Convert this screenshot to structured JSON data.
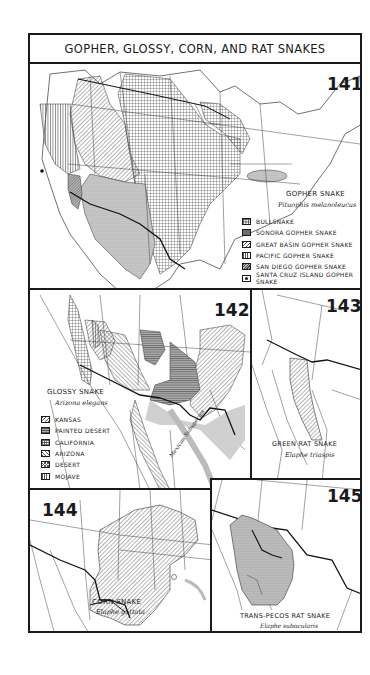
{
  "page": {
    "title": "GOPHER, GLOSSY, CORN, AND RAT SNAKES"
  },
  "maps": [
    {
      "number": "141",
      "common_name": "GOPHER SNAKE",
      "scientific_name": "Pituophis melanoleucus",
      "legend": [
        {
          "label": "BULLSNAKE",
          "pattern": "cross-grid"
        },
        {
          "label": "SONORA GOPHER SNAKE",
          "pattern": "stipple"
        },
        {
          "label": "GREAT BASIN GOPHER SNAKE",
          "pattern": "diagonal-lines"
        },
        {
          "label": "PACIFIC GOPHER SNAKE",
          "pattern": "vertical-lines"
        },
        {
          "label": "SAN DIEGO GOPHER SNAKE",
          "pattern": "dense-diagonal"
        },
        {
          "label": "SANTA CRUZ ISLAND GOPHER SNAKE",
          "pattern": "dot-in-box"
        }
      ]
    },
    {
      "number": "142",
      "common_name": "GLOSSY SNAKE",
      "scientific_name": "Arizona elegans",
      "annotation": "Mexican Subspecies",
      "legend": [
        {
          "label": "KANSAS",
          "pattern": "diagonal-lines"
        },
        {
          "label": "PAINTED DESERT",
          "pattern": "horizontal-lines"
        },
        {
          "label": "CALIFORNIA",
          "pattern": "grid"
        },
        {
          "label": "ARIZONA",
          "pattern": "reverse-diagonal"
        },
        {
          "label": "DESERT",
          "pattern": "crosshatch"
        },
        {
          "label": "MOJAVE",
          "pattern": "vertical-lines"
        }
      ]
    },
    {
      "number": "143",
      "common_name": "GREEN RAT SNAKE",
      "scientific_name": "Elaphe triaspis"
    },
    {
      "number": "144",
      "common_name": "CORN SNAKE",
      "scientific_name": "Elaphe guttata"
    },
    {
      "number": "145",
      "common_name": "TRANS-PECOS RAT SNAKE",
      "scientific_name": "Elaphe subocularis"
    }
  ],
  "colors": {
    "ink": "#1a1a1a",
    "paper": "#ffffff",
    "range_shading": "#c8c8c8"
  }
}
